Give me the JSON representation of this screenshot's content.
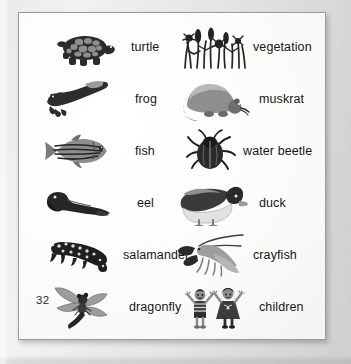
{
  "page": {
    "number": "32",
    "kind": "illustrated-picture-glossary",
    "background_color": "#fdfdfc",
    "text_color": "#161616",
    "frame_border_color": "#9a9a98"
  },
  "entries": [
    {
      "label": "turtle",
      "icon": "turtle-illustration",
      "column": "left",
      "row": 1
    },
    {
      "label": "vegetation",
      "icon": "vegetation-illustration",
      "column": "right",
      "row": 1
    },
    {
      "label": "frog",
      "icon": "frog-illustration",
      "column": "left",
      "row": 2
    },
    {
      "label": "muskrat",
      "icon": "muskrat-illustration",
      "column": "right",
      "row": 2
    },
    {
      "label": "fish",
      "icon": "fish-illustration",
      "column": "left",
      "row": 3
    },
    {
      "label": "water beetle",
      "icon": "water-beetle-illustration",
      "column": "right",
      "row": 3
    },
    {
      "label": "eel",
      "icon": "eel-illustration",
      "column": "left",
      "row": 4
    },
    {
      "label": "duck",
      "icon": "duck-illustration",
      "column": "right",
      "row": 4
    },
    {
      "label": "salamander",
      "icon": "salamander-illustration",
      "column": "left",
      "row": 5
    },
    {
      "label": "crayfish",
      "icon": "crayfish-illustration",
      "column": "right",
      "row": 5
    },
    {
      "label": "dragonfly",
      "icon": "dragonfly-illustration",
      "column": "left",
      "row": 6
    },
    {
      "label": "children",
      "icon": "children-illustration",
      "column": "right",
      "row": 6
    }
  ]
}
